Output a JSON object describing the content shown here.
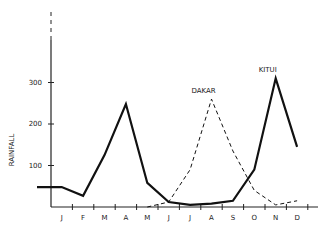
{
  "chart_data": {
    "type": "line",
    "title": "",
    "xlabel": "",
    "ylabel": "RAINFALL",
    "categories": [
      "J",
      "F",
      "M",
      "A",
      "M",
      "J",
      "J",
      "A",
      "S",
      "O",
      "N",
      "D"
    ],
    "yticks": [
      100,
      200,
      300
    ],
    "ylim": [
      0,
      420
    ],
    "grid": false,
    "series": [
      {
        "name": "KITUI",
        "style": "solid",
        "values": [
          48,
          27,
          125,
          248,
          58,
          12,
          5,
          8,
          15,
          90,
          310,
          145
        ]
      },
      {
        "name": "DAKAR",
        "style": "dashed",
        "values": [
          null,
          null,
          null,
          null,
          0,
          12,
          90,
          260,
          135,
          40,
          5,
          15
        ]
      }
    ]
  }
}
